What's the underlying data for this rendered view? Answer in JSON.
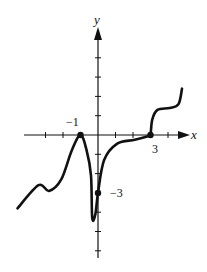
{
  "chart_data": {
    "type": "line",
    "title": "",
    "xlabel": "x",
    "ylabel": "y",
    "xlim": [
      -4,
      4.5
    ],
    "ylim": [
      -6.5,
      5.5
    ],
    "x_ticks": [
      -3,
      -2,
      -1,
      0,
      1,
      2,
      3,
      4
    ],
    "y_ticks": [
      -6,
      -5,
      -4,
      -3,
      -2,
      -1,
      1,
      2,
      3,
      4,
      5
    ],
    "tick_labels": [
      {
        "text": "−1",
        "axis": "x",
        "value": -1
      },
      {
        "text": "3",
        "axis": "x",
        "value": 3
      },
      {
        "text": "−3",
        "axis": "y",
        "value": -3
      }
    ],
    "series": [
      {
        "name": "f",
        "x": [
          -4.6,
          -3.4,
          -2.8,
          -2.1,
          -1.5,
          -1.0,
          -0.65,
          -0.4,
          -0.33,
          -0.15,
          0.0,
          0.35,
          1.1,
          2.1,
          2.9,
          3.0,
          3.1,
          3.4,
          4.1,
          4.6,
          4.8
        ],
        "y": [
          -3.8,
          -2.6,
          -2.9,
          -2.3,
          -0.8,
          0.0,
          -0.8,
          -2.1,
          -4.3,
          -4.1,
          -3.0,
          -1.3,
          -0.45,
          -0.25,
          -0.05,
          0.0,
          0.8,
          1.3,
          1.4,
          1.6,
          2.4
        ]
      }
    ],
    "marked_points": [
      {
        "x": -1,
        "y": 0
      },
      {
        "x": 0,
        "y": -3
      },
      {
        "x": 3,
        "y": 0
      }
    ],
    "grid": false,
    "legend": "none"
  }
}
